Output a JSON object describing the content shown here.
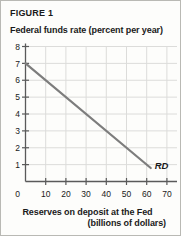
{
  "figure": {
    "label": "FIGURE 1"
  },
  "chart_data": {
    "type": "line",
    "title": "FIGURE 1",
    "ylabel": "Federal funds rate (percent per year)",
    "xlabel": "Reserves on deposit at the Fed",
    "xlabel_sub": "(billions of dollars)",
    "xlim": [
      0,
      75
    ],
    "ylim": [
      0,
      8
    ],
    "grid": true,
    "legend": "none",
    "xticks": [
      0,
      10,
      20,
      30,
      40,
      50,
      60,
      70
    ],
    "xtick_labels": [
      "0",
      "10",
      "20",
      "30",
      "40",
      "50",
      "60",
      "70"
    ],
    "yticks": [
      0,
      1,
      2,
      3,
      4,
      5,
      6,
      7,
      8
    ],
    "ytick_labels": [
      "0",
      "1",
      "2",
      "3",
      "4",
      "5",
      "6",
      "7",
      "8"
    ],
    "series": [
      {
        "name": "RD",
        "annotation": "RD",
        "color": "#7d7d7d",
        "x": [
          0,
          62
        ],
        "y": [
          7,
          0.8
        ]
      }
    ]
  }
}
